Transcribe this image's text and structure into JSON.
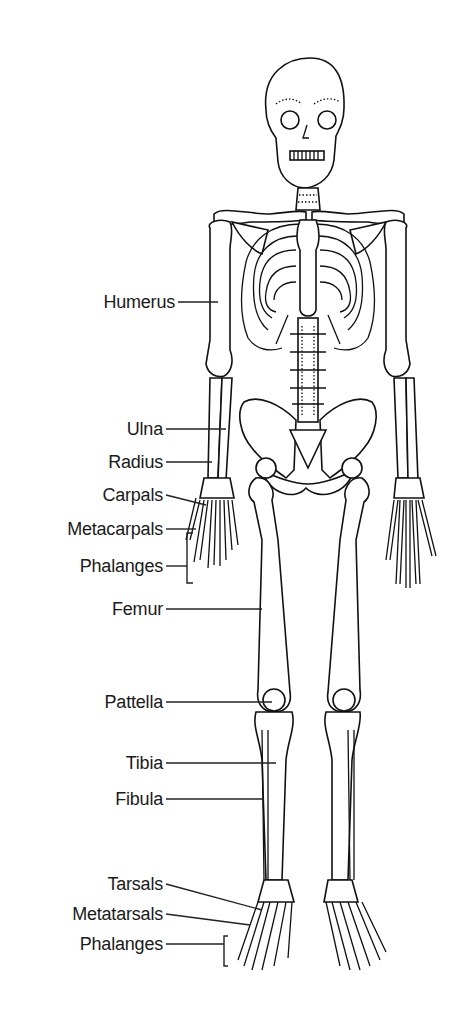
{
  "diagram": {
    "type": "anatomical skeleton, anterior view",
    "labels": [
      {
        "id": "humerus",
        "text": "Humerus",
        "right": 175,
        "top": 292
      },
      {
        "id": "ulna",
        "text": "Ulna",
        "right": 163,
        "top": 419
      },
      {
        "id": "radius",
        "text": "Radius",
        "right": 163,
        "top": 452
      },
      {
        "id": "carpals",
        "text": "Carpals",
        "right": 163,
        "top": 485
      },
      {
        "id": "metacarpals",
        "text": "Metacarpals",
        "right": 163,
        "top": 519
      },
      {
        "id": "phalanges-hand",
        "text": "Phalanges",
        "right": 163,
        "top": 556
      },
      {
        "id": "femur",
        "text": "Femur",
        "right": 163,
        "top": 599
      },
      {
        "id": "pattella",
        "text": "Pattella",
        "right": 163,
        "top": 692
      },
      {
        "id": "tibia",
        "text": "Tibia",
        "right": 163,
        "top": 753
      },
      {
        "id": "fibula",
        "text": "Fibula",
        "right": 163,
        "top": 789
      },
      {
        "id": "tarsals",
        "text": "Tarsals",
        "right": 163,
        "top": 874
      },
      {
        "id": "metatarsals",
        "text": "Metatarsals",
        "right": 163,
        "top": 904
      },
      {
        "id": "phalanges-foot",
        "text": "Phalanges",
        "right": 163,
        "top": 934
      }
    ]
  }
}
